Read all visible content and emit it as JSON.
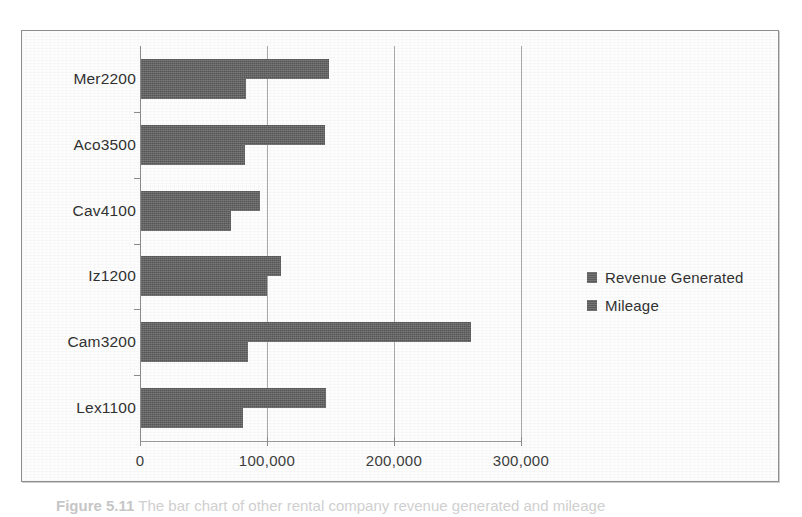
{
  "chart_data": {
    "type": "bar",
    "orientation": "horizontal",
    "title": "",
    "xlabel": "",
    "ylabel": "",
    "categories": [
      "Mer2200",
      "Aco3500",
      "Cav4100",
      "Iz1200",
      "Cam3200",
      "Lex1100"
    ],
    "series": [
      {
        "name": "Revenue Generated",
        "color": "#5d5d5d",
        "values": [
          148000,
          145000,
          94000,
          110000,
          260000,
          146000
        ]
      },
      {
        "name": "Mileage",
        "color": "#5d5d5d",
        "values": [
          83000,
          82000,
          71000,
          99000,
          84000,
          80000
        ]
      }
    ],
    "xlim": [
      0,
      300000
    ],
    "xticks": [
      0,
      100000,
      200000,
      300000
    ],
    "xtick_labels": [
      "0",
      "100,000",
      "200,000",
      "300,000"
    ],
    "grid": true,
    "grid_axis": "x",
    "legend_position": "right",
    "plot_background": "#fdfdfd",
    "frame_color": "#8d8d8d"
  },
  "legend": {
    "entries": [
      {
        "label": "Revenue Generated"
      },
      {
        "label": "Mileage"
      }
    ]
  },
  "caption": {
    "figure_number": "Figure 5.11",
    "text": "The bar chart of other rental company revenue generated and mileage"
  }
}
